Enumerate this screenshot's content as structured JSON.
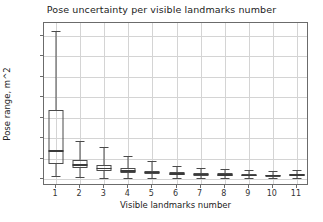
{
  "chart_data": {
    "type": "box",
    "title": "Pose uncertainty per visible landmarks number",
    "xlabel": "Visible landmarks number",
    "ylabel": "Pose range, m^2",
    "grid": true,
    "legend": null,
    "xlim": [
      0.5,
      11.5
    ],
    "ylim": [
      -0.85,
      19.1
    ],
    "xticks": [
      "1",
      "2",
      "3",
      "4",
      "5",
      "6",
      "7",
      "8",
      "9",
      "10",
      "11"
    ],
    "yticks": [
      "0.0",
      "2.5",
      "5.0",
      "7.5",
      "10.0",
      "12.5",
      "15.0",
      "17.5"
    ],
    "ytick_values": [
      0.0,
      2.5,
      5.0,
      7.5,
      10.0,
      12.5,
      15.0,
      17.5
    ],
    "categories": [
      1,
      2,
      3,
      4,
      5,
      6,
      7,
      8,
      9,
      10,
      11
    ],
    "boxes": [
      {
        "category": 1,
        "whisker_low": 0.35,
        "q1": 1.8,
        "median": 3.45,
        "q3": 8.45,
        "whisker_high": 18.1
      },
      {
        "category": 2,
        "whisker_low": 0.2,
        "q1": 1.3,
        "median": 1.75,
        "q3": 2.35,
        "whisker_high": 4.6
      },
      {
        "category": 3,
        "whisker_low": 0.1,
        "q1": 1.0,
        "median": 1.3,
        "q3": 1.75,
        "whisker_high": 3.9
      },
      {
        "category": 4,
        "whisker_low": 0.18,
        "q1": 0.75,
        "median": 0.95,
        "q3": 1.3,
        "whisker_high": 2.85
      },
      {
        "category": 5,
        "whisker_low": 0.15,
        "q1": 0.6,
        "median": 0.78,
        "q3": 1.0,
        "whisker_high": 2.25
      },
      {
        "category": 6,
        "whisker_low": 0.12,
        "q1": 0.48,
        "median": 0.62,
        "q3": 0.82,
        "whisker_high": 1.65
      },
      {
        "category": 7,
        "whisker_low": 0.12,
        "q1": 0.42,
        "median": 0.55,
        "q3": 0.72,
        "whisker_high": 1.35
      },
      {
        "category": 8,
        "whisker_low": 0.12,
        "q1": 0.4,
        "median": 0.52,
        "q3": 0.68,
        "whisker_high": 1.25
      },
      {
        "category": 9,
        "whisker_low": 0.1,
        "q1": 0.35,
        "median": 0.45,
        "q3": 0.58,
        "whisker_high": 1.05
      },
      {
        "category": 10,
        "whisker_low": 0.1,
        "q1": 0.32,
        "median": 0.42,
        "q3": 0.55,
        "whisker_high": 0.95
      },
      {
        "category": 11,
        "whisker_low": 0.12,
        "q1": 0.4,
        "median": 0.5,
        "q3": 0.62,
        "whisker_high": 1.1
      }
    ],
    "colors": {
      "background": "#ffffff",
      "grid": "#d4d4d4",
      "box_edge": "#4a4a4a",
      "median": "#3a3a3a",
      "spine": "#6b6b6b",
      "text": "#222222"
    }
  }
}
